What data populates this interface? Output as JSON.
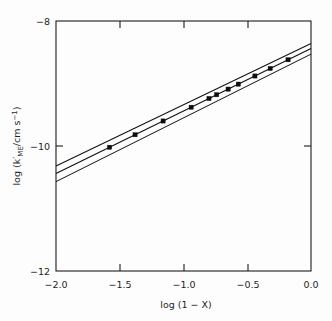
{
  "figure": {
    "background_color": "#fdfdfd",
    "foreground_color": "#1c1c1c",
    "width_px": 332,
    "height_px": 321
  },
  "axes": {
    "x_title": "log (1 − X)",
    "y_title_prefix": "log (k′",
    "y_title_sub": "ME",
    "y_title_mid": "/cm s",
    "y_title_sup": "−1",
    "y_title_suffix": ")",
    "x_tick_labels": [
      "−2.0",
      "−1.5",
      "−1.0",
      "−0.5",
      "0.0"
    ],
    "y_tick_labels": [
      "−8",
      "−10",
      "−12"
    ]
  },
  "chart_data": {
    "type": "scatter",
    "title": "",
    "subtitle": "",
    "xlabel": "log (1 − X)",
    "ylabel": "log (k'_ME/cm s^-1)",
    "xlim": [
      -2.0,
      0.0
    ],
    "ylim": [
      -12,
      -8
    ],
    "xticks": [
      -2.0,
      -1.5,
      -1.0,
      -0.5,
      0.0
    ],
    "yticks": [
      -12,
      -10,
      -8
    ],
    "grid": false,
    "legend": null,
    "series": [
      {
        "name": "data points",
        "type": "scatter",
        "marker": "filled-square",
        "x": [
          -1.58,
          -1.38,
          -1.16,
          -0.94,
          -0.8,
          -0.74,
          -0.65,
          -0.57,
          -0.44,
          -0.32,
          -0.18
        ],
        "y": [
          -10.02,
          -9.82,
          -9.6,
          -9.38,
          -9.24,
          -9.18,
          -9.09,
          -9.01,
          -8.88,
          -8.76,
          -8.62
        ]
      },
      {
        "name": "regression line",
        "type": "line",
        "x": [
          -2.0,
          0.0
        ],
        "y": [
          -10.44,
          -8.44
        ]
      },
      {
        "name": "upper confidence band",
        "type": "line",
        "x": [
          -2.0,
          0.0
        ],
        "y": [
          -10.32,
          -8.36
        ]
      },
      {
        "name": "lower confidence band",
        "type": "line",
        "x": [
          -2.0,
          0.0
        ],
        "y": [
          -10.57,
          -8.53
        ]
      }
    ],
    "annotations": []
  }
}
